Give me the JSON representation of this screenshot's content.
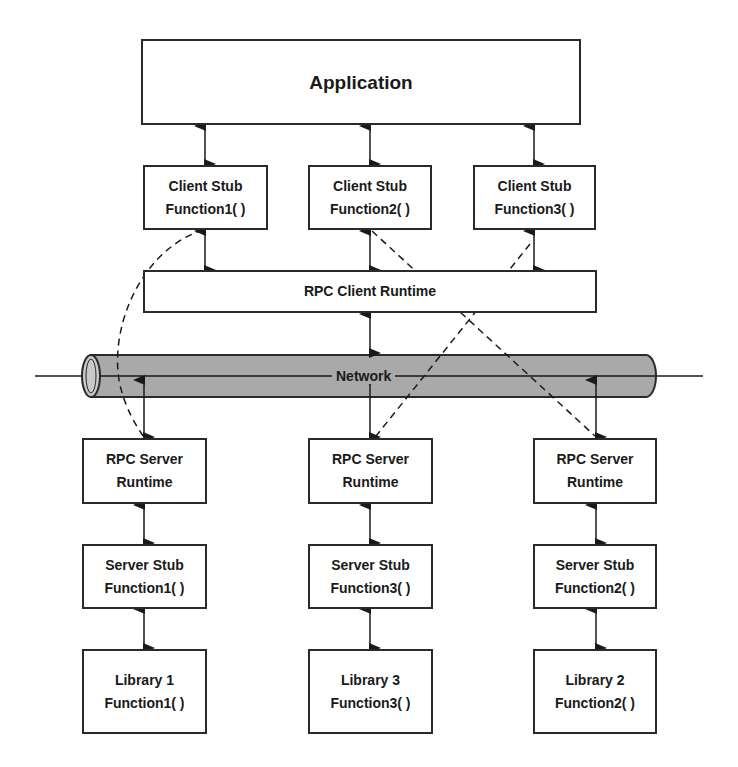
{
  "diagram": {
    "application": {
      "label": "Application"
    },
    "client_stubs": [
      {
        "title": "Client Stub",
        "function": "Function1( )"
      },
      {
        "title": "Client Stub",
        "function": "Function2( )"
      },
      {
        "title": "Client Stub",
        "function": "Function3( )"
      }
    ],
    "rpc_client_runtime": {
      "label": "RPC Client Runtime"
    },
    "network": {
      "label": "Network",
      "fill_color": "#a9a9a9"
    },
    "rpc_server_runtimes": [
      {
        "title": "RPC Server",
        "subtitle": "Runtime"
      },
      {
        "title": "RPC Server",
        "subtitle": "Runtime"
      },
      {
        "title": "RPC Server",
        "subtitle": "Runtime"
      }
    ],
    "server_stubs": [
      {
        "title": "Server Stub",
        "function": "Function1( )"
      },
      {
        "title": "Server Stub",
        "function": "Function3( )"
      },
      {
        "title": "Server Stub",
        "function": "Function2( )"
      }
    ],
    "libraries": [
      {
        "title": "Library 1",
        "function": "Function1( )"
      },
      {
        "title": "Library 3",
        "function": "Function3( )"
      },
      {
        "title": "Library 2",
        "function": "Function2( )"
      }
    ],
    "dashed_routes": [
      {
        "from": "Client Stub Function1( )",
        "to": "RPC Server Runtime (column 1)"
      },
      {
        "from": "Client Stub Function2( )",
        "to": "RPC Server Runtime (column 3)"
      },
      {
        "from": "Client Stub Function3( )",
        "to": "RPC Server Runtime (column 2)"
      }
    ]
  }
}
